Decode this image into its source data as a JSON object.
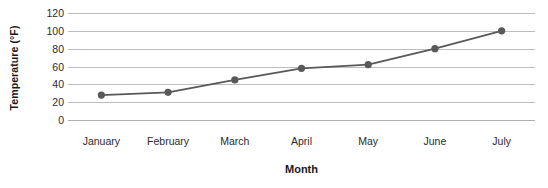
{
  "chart_data": {
    "type": "line",
    "title": "",
    "xlabel": "Month",
    "ylabel": "Temperature (°F)",
    "categories": [
      "January",
      "February",
      "March",
      "April",
      "May",
      "June",
      "July"
    ],
    "values": [
      28,
      31,
      45,
      58,
      62,
      80,
      100
    ],
    "series": [
      {
        "name": "Temperature",
        "values": [
          28,
          31,
          45,
          58,
          62,
          80,
          100
        ]
      }
    ],
    "ylim": [
      0,
      120
    ],
    "yticks": [
      0,
      20,
      40,
      60,
      80,
      100,
      120
    ],
    "ytick_labels": [
      "0",
      "20",
      "40",
      "60",
      "80",
      "100",
      "120"
    ],
    "grid": true,
    "legend": false,
    "legend_position": "none",
    "colors": {
      "line": "#595959",
      "marker": "#595959",
      "gridline": "#bdbdbd",
      "text": "#2b2b2b",
      "title_text": "#1a1a1a",
      "background": "#ffffff"
    }
  }
}
